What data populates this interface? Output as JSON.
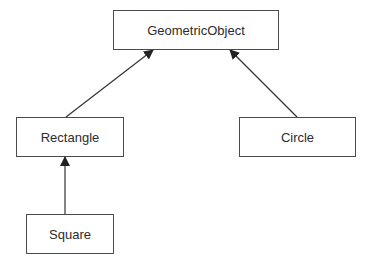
{
  "diagram": {
    "type": "uml-class-inheritance",
    "nodes": [
      {
        "id": "geometric",
        "label": "GeometricObject"
      },
      {
        "id": "rectangle",
        "label": "Rectangle"
      },
      {
        "id": "circle",
        "label": "Circle"
      },
      {
        "id": "square",
        "label": "Square"
      }
    ],
    "edges": [
      {
        "from": "Rectangle",
        "to": "GeometricObject",
        "kind": "extends"
      },
      {
        "from": "Circle",
        "to": "GeometricObject",
        "kind": "extends"
      },
      {
        "from": "Square",
        "to": "Rectangle",
        "kind": "extends"
      }
    ],
    "colors": {
      "stroke": "#4a4a4a",
      "text": "#2c2c2c",
      "background": "#ffffff"
    }
  }
}
